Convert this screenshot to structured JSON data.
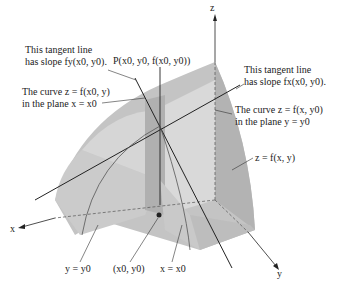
{
  "labels": {
    "z_axis": "z",
    "x_axis": "x",
    "y_axis": "y",
    "point_P": "P(x0, y0, f(x0, y0))",
    "tangent_y_line1": "This tangent line",
    "tangent_y_line2": "has slope fy(x0, y0).",
    "tangent_x_line1": "This tangent line",
    "tangent_x_line2": "has slope fx(x0, y0).",
    "curve_x0_line1": "The curve z = f(x0, y)",
    "curve_x0_line2": "in the plane x = x0",
    "curve_y0_line1": "The curve z = f(x, y0)",
    "curve_y0_line2": "in the plane y = y0",
    "surface": "z = f(x, y)",
    "plane_y": "y = y0",
    "base_point": "(x0, y0)",
    "plane_x": "x = x0"
  },
  "colors": {
    "surface_light": "#d4d4d4",
    "surface_mid": "#bdbdbd",
    "surface_dark": "#a8a8a8",
    "line": "#222222",
    "leader": "#555555"
  }
}
